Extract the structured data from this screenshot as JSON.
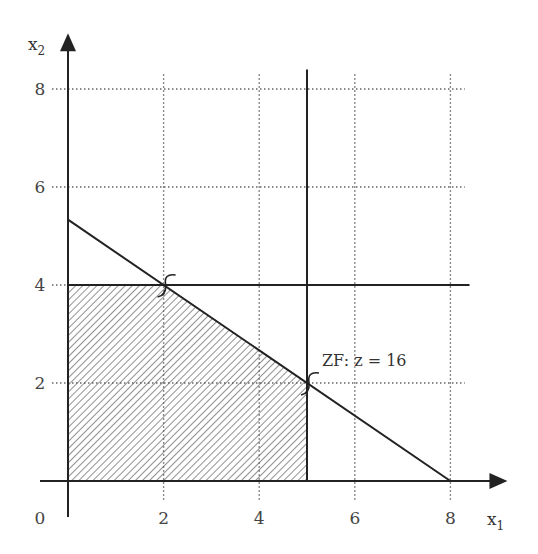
{
  "chart_data": {
    "type": "line",
    "title": "",
    "xlabel": "x",
    "xlabel_sub": "1",
    "ylabel": "x",
    "ylabel_sub": "2",
    "xlim": [
      0,
      8.5
    ],
    "ylim": [
      0,
      8.5
    ],
    "x_ticks": [
      "0",
      "2",
      "4",
      "6",
      "8"
    ],
    "y_ticks": [
      "2",
      "4",
      "6",
      "8"
    ],
    "grid": true,
    "constraints": [
      {
        "name": "2x1+3x2=16",
        "points": [
          [
            0,
            5.333
          ],
          [
            8,
            0
          ]
        ]
      },
      {
        "name": "x2=4",
        "points": [
          [
            0,
            4
          ],
          [
            8.4,
            4
          ]
        ]
      },
      {
        "name": "x1=5",
        "points": [
          [
            5,
            0
          ],
          [
            5,
            8.4
          ]
        ]
      }
    ],
    "feasible_region": [
      [
        0,
        0
      ],
      [
        0,
        4
      ],
      [
        2,
        4
      ],
      [
        5,
        2
      ],
      [
        5,
        0
      ]
    ],
    "markers": [
      [
        2,
        4
      ],
      [
        5,
        2
      ]
    ],
    "annotation": {
      "text": "ZF:  z = 16",
      "at": [
        5,
        2
      ]
    }
  }
}
